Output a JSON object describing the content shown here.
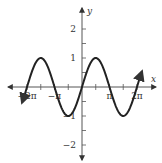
{
  "chart_data": {
    "type": "line",
    "title": "",
    "function": "y = sin(x)",
    "xlabel": "x",
    "ylabel": "y",
    "xlim": [
      -7.2,
      7.2
    ],
    "ylim": [
      -2.7,
      2.7
    ],
    "domain_drawn": [
      -6.85,
      6.85
    ],
    "x_ticks": [
      {
        "value": -6.2832,
        "label": "−2π"
      },
      {
        "value": -4.7124,
        "label": ""
      },
      {
        "value": -3.1416,
        "label": "−π"
      },
      {
        "value": -1.5708,
        "label": ""
      },
      {
        "value": 1.5708,
        "label": ""
      },
      {
        "value": 3.1416,
        "label": "π"
      },
      {
        "value": 4.7124,
        "label": ""
      },
      {
        "value": 6.2832,
        "label": "2π"
      }
    ],
    "y_ticks": [
      {
        "value": 2,
        "label": "2"
      },
      {
        "value": 1.5,
        "label": ""
      },
      {
        "value": 1,
        "label": "1"
      },
      {
        "value": 0.5,
        "label": ""
      },
      {
        "value": -0.5,
        "label": ""
      },
      {
        "value": -1,
        "label": "−1"
      },
      {
        "value": -1.5,
        "label": ""
      },
      {
        "value": -2,
        "label": "−2"
      }
    ],
    "series": [
      {
        "name": "sin(x)",
        "x": [
          -6.2832,
          -4.7124,
          -3.1416,
          -1.5708,
          0,
          1.5708,
          3.1416,
          4.7124,
          6.2832
        ],
        "values": [
          0,
          1,
          0,
          -1,
          0,
          1,
          0,
          -1,
          0
        ]
      }
    ],
    "grid": false,
    "legend": null,
    "arrows_on_axes": true,
    "arrows_on_curve_ends": true
  },
  "style": {
    "axis_color": "#555555",
    "curve_color": "#222222",
    "background": "#ffffff"
  },
  "layout": {
    "origin_px": [
      82,
      87
    ],
    "px_per_x_unit": 8.75,
    "px_per_y_unit": 29
  }
}
